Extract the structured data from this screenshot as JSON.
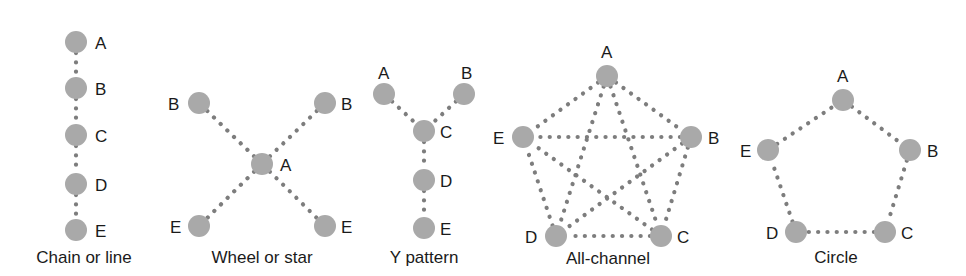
{
  "style": {
    "node_color": "#a9a9a9",
    "edge_color": "#7d7d7d",
    "text_color": "#1a1a1a",
    "background": "#ffffff",
    "node_radius": 11
  },
  "networks": [
    {
      "id": "chain",
      "caption": "Chain or line",
      "caption_pos": [
        84,
        263
      ],
      "nodes": [
        {
          "id": "A",
          "label": "A",
          "x": 76,
          "y": 42,
          "lx": 95,
          "ly": 49
        },
        {
          "id": "B",
          "label": "B",
          "x": 76,
          "y": 88,
          "lx": 95,
          "ly": 95
        },
        {
          "id": "C",
          "label": "C",
          "x": 76,
          "y": 135,
          "lx": 95,
          "ly": 142
        },
        {
          "id": "D",
          "label": "D",
          "x": 76,
          "y": 184,
          "lx": 95,
          "ly": 191
        },
        {
          "id": "E",
          "label": "E",
          "x": 76,
          "y": 230,
          "lx": 95,
          "ly": 237
        }
      ],
      "edges": [
        [
          "A",
          "B"
        ],
        [
          "B",
          "C"
        ],
        [
          "C",
          "D"
        ],
        [
          "D",
          "E"
        ]
      ]
    },
    {
      "id": "wheel",
      "caption": "Wheel or star",
      "caption_pos": [
        262,
        263
      ],
      "nodes": [
        {
          "id": "B1",
          "label": "B",
          "x": 199,
          "y": 103,
          "lx": 168,
          "ly": 110
        },
        {
          "id": "B2",
          "label": "B",
          "x": 325,
          "y": 103,
          "lx": 341,
          "ly": 110
        },
        {
          "id": "A",
          "label": "A",
          "x": 262,
          "y": 164,
          "lx": 280,
          "ly": 171
        },
        {
          "id": "E1",
          "label": "E",
          "x": 199,
          "y": 226,
          "lx": 170,
          "ly": 233
        },
        {
          "id": "E2",
          "label": "E",
          "x": 325,
          "y": 226,
          "lx": 341,
          "ly": 233
        }
      ],
      "edges": [
        [
          "A",
          "B1"
        ],
        [
          "A",
          "B2"
        ],
        [
          "A",
          "E1"
        ],
        [
          "A",
          "E2"
        ]
      ]
    },
    {
      "id": "y-pattern",
      "caption": "Y pattern",
      "caption_pos": [
        424,
        263
      ],
      "nodes": [
        {
          "id": "A",
          "label": "A",
          "x": 384,
          "y": 94,
          "lx": 378,
          "ly": 79
        },
        {
          "id": "B",
          "label": "B",
          "x": 464,
          "y": 94,
          "lx": 461,
          "ly": 79
        },
        {
          "id": "C",
          "label": "C",
          "x": 424,
          "y": 131,
          "lx": 440,
          "ly": 138
        },
        {
          "id": "D",
          "label": "D",
          "x": 424,
          "y": 180,
          "lx": 440,
          "ly": 187
        },
        {
          "id": "E",
          "label": "E",
          "x": 424,
          "y": 228,
          "lx": 440,
          "ly": 235
        }
      ],
      "edges": [
        [
          "A",
          "C"
        ],
        [
          "B",
          "C"
        ],
        [
          "C",
          "D"
        ],
        [
          "D",
          "E"
        ]
      ]
    },
    {
      "id": "all-channel",
      "caption": "All-channel",
      "caption_pos": [
        608,
        264
      ],
      "nodes": [
        {
          "id": "A",
          "label": "A",
          "x": 607,
          "y": 76,
          "lx": 601,
          "ly": 58
        },
        {
          "id": "B",
          "label": "B",
          "x": 691,
          "y": 137,
          "lx": 708,
          "ly": 144
        },
        {
          "id": "C",
          "label": "C",
          "x": 661,
          "y": 236,
          "lx": 677,
          "ly": 243
        },
        {
          "id": "D",
          "label": "D",
          "x": 556,
          "y": 236,
          "lx": 525,
          "ly": 243
        },
        {
          "id": "E",
          "label": "E",
          "x": 523,
          "y": 137,
          "lx": 493,
          "ly": 144
        }
      ],
      "edges": [
        [
          "A",
          "B"
        ],
        [
          "A",
          "C"
        ],
        [
          "A",
          "D"
        ],
        [
          "A",
          "E"
        ],
        [
          "B",
          "C"
        ],
        [
          "B",
          "D"
        ],
        [
          "B",
          "E"
        ],
        [
          "C",
          "D"
        ],
        [
          "C",
          "E"
        ],
        [
          "D",
          "E"
        ]
      ]
    },
    {
      "id": "circle",
      "caption": "Circle",
      "caption_pos": [
        836,
        263
      ],
      "nodes": [
        {
          "id": "A",
          "label": "A",
          "x": 843,
          "y": 100,
          "lx": 837,
          "ly": 82
        },
        {
          "id": "B",
          "label": "B",
          "x": 910,
          "y": 150,
          "lx": 927,
          "ly": 157
        },
        {
          "id": "C",
          "label": "C",
          "x": 885,
          "y": 232,
          "lx": 901,
          "ly": 239
        },
        {
          "id": "D",
          "label": "D",
          "x": 796,
          "y": 232,
          "lx": 766,
          "ly": 239
        },
        {
          "id": "E",
          "label": "E",
          "x": 768,
          "y": 150,
          "lx": 740,
          "ly": 157
        }
      ],
      "edges": [
        [
          "A",
          "B"
        ],
        [
          "B",
          "C"
        ],
        [
          "C",
          "D"
        ],
        [
          "D",
          "E"
        ],
        [
          "E",
          "A"
        ]
      ]
    }
  ]
}
